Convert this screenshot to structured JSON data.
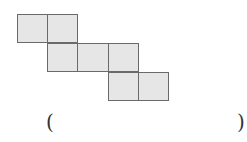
{
  "figure": {
    "fill_color": "#e6e6e6",
    "border_color": "#6a6a6a",
    "cells": [
      {
        "row": 0,
        "col": 0
      },
      {
        "row": 0,
        "col": 1
      },
      {
        "row": 1,
        "col": 1
      },
      {
        "row": 1,
        "col": 2
      },
      {
        "row": 1,
        "col": 3
      },
      {
        "row": 2,
        "col": 3
      },
      {
        "row": 2,
        "col": 4
      }
    ]
  },
  "answer": {
    "open_paren": "(",
    "close_paren": ")",
    "value": ""
  }
}
